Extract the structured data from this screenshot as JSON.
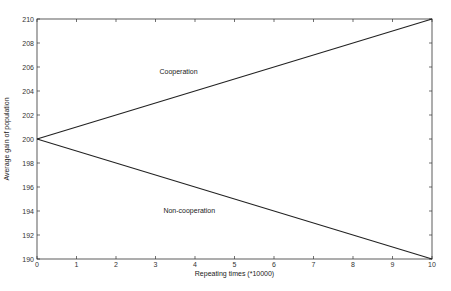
{
  "chart_data": {
    "type": "line",
    "title": "",
    "xlabel": "Repeating times (*10000)",
    "ylabel": "Average gain of population",
    "xlim": [
      0,
      10
    ],
    "ylim": [
      190,
      210
    ],
    "xticks": [
      0,
      1,
      2,
      3,
      4,
      5,
      6,
      7,
      8,
      9,
      10
    ],
    "yticks": [
      190,
      192,
      194,
      196,
      198,
      200,
      202,
      204,
      206,
      208,
      210
    ],
    "grid": false,
    "legend": null,
    "series": [
      {
        "name": "Cooperation",
        "x": [
          0,
          10
        ],
        "y": [
          200,
          210
        ],
        "color": "#222222"
      },
      {
        "name": "Non-cooperation",
        "x": [
          0,
          10
        ],
        "y": [
          200,
          190
        ],
        "color": "#222222"
      }
    ],
    "annotations": [
      {
        "text": "Cooperation",
        "x": 3.1,
        "y": 205.4
      },
      {
        "text": "Non-cooperation",
        "x": 3.2,
        "y": 193.8
      }
    ]
  }
}
